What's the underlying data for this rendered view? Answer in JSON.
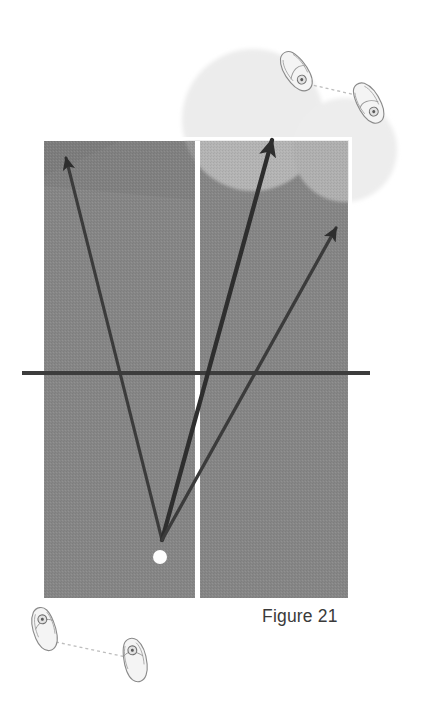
{
  "figure": {
    "caption": "Figure 21",
    "background_color": "#ffffff",
    "court": {
      "name": "tennis-court",
      "fill_color": "#868686",
      "border_color": "#ffffff",
      "x": 44,
      "y": 141,
      "width": 304,
      "height": 457,
      "center_service_line": {
        "color": "#ffffff",
        "x": 195,
        "width": 5,
        "top": 141,
        "bottom": 598
      },
      "baseline_overlay": {
        "color": "#adadad",
        "note": "lighter shaded wedge where the light zone circles overlap the court"
      }
    },
    "service_line": {
      "name": "horizontal-service-line",
      "color": "#3d3d3d",
      "x1": 22,
      "y1": 373,
      "x2": 370,
      "y2": 373,
      "thickness": 4
    },
    "ball": {
      "name": "tennis-ball",
      "color": "#fdfdfd",
      "cx": 160,
      "cy": 557,
      "r": 7
    },
    "light_zones": [
      {
        "name": "target-zone-left",
        "color": "#ececec",
        "cx": 253,
        "cy": 120,
        "rx": 71,
        "ry": 71
      },
      {
        "name": "target-zone-right",
        "color": "#ededed",
        "cx": 345,
        "cy": 150,
        "rx": 52,
        "ry": 52
      }
    ],
    "shot_arrows": [
      {
        "name": "shot-arrow-cross-court-left",
        "color": "#3b3b3b",
        "from_x": 162,
        "from_y": 540,
        "to_x": 66,
        "to_y": 158
      },
      {
        "name": "shot-arrow-down-the-middle",
        "color": "#2e2e2e",
        "from_x": 162,
        "from_y": 540,
        "to_x": 272,
        "to_y": 140
      },
      {
        "name": "shot-arrow-cross-court-right",
        "color": "#3b3b3b",
        "from_x": 162,
        "from_y": 540,
        "to_x": 336,
        "to_y": 228
      }
    ],
    "player_positions": [
      {
        "name": "player-footprints-top",
        "label": "opponent-feet-upper-right",
        "outline_color": "#8a8a8a",
        "connector_color": "#b9b9b9",
        "foot_left": {
          "cx": 297,
          "cy": 72,
          "angle": -32
        },
        "foot_right": {
          "cx": 369,
          "cy": 104,
          "angle": -32
        },
        "connector": {
          "x1": 308,
          "y1": 84,
          "x2": 360,
          "y2": 96
        }
      },
      {
        "name": "player-footprints-bottom",
        "label": "player-feet-lower-left",
        "outline_color": "#8a8a8a",
        "connector_color": "#b9b9b9",
        "foot_left": {
          "cx": 45,
          "cy": 630,
          "angle": -16
        },
        "foot_right": {
          "cx": 135,
          "cy": 660,
          "angle": -16
        },
        "connector": {
          "x1": 56,
          "y1": 642,
          "x2": 126,
          "y2": 656
        }
      }
    ]
  }
}
